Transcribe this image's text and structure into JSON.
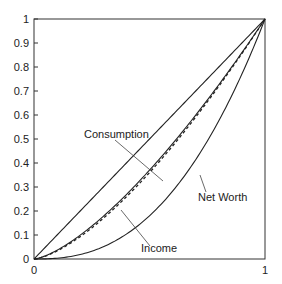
{
  "chart_data": {
    "type": "line",
    "title": "",
    "xlabel": "",
    "ylabel": "",
    "xlim": [
      0,
      1
    ],
    "ylim": [
      0,
      1
    ],
    "grid": false,
    "legend": "none (curves labeled directly with leader lines)",
    "x_ticks": [
      "0",
      "1"
    ],
    "y_ticks": [
      "0",
      "0.1",
      "0.2",
      "0.3",
      "0.4",
      "0.5",
      "0.6",
      "0.7",
      "0.8",
      "0.9",
      "1"
    ],
    "x": [
      0,
      0.1,
      0.2,
      0.3,
      0.4,
      0.5,
      0.6,
      0.7,
      0.8,
      0.9,
      1.0
    ],
    "series": [
      {
        "name": "Equality line",
        "style": "solid",
        "values": [
          0,
          0.1,
          0.2,
          0.3,
          0.4,
          0.5,
          0.6,
          0.7,
          0.8,
          0.9,
          1.0
        ]
      },
      {
        "name": "Consumption",
        "style": "solid",
        "values": [
          0,
          0.037,
          0.1,
          0.18,
          0.27,
          0.37,
          0.48,
          0.6,
          0.73,
          0.86,
          1.0
        ]
      },
      {
        "name": "Income",
        "style": "dashed",
        "values": [
          0,
          0.034,
          0.094,
          0.17,
          0.26,
          0.36,
          0.47,
          0.59,
          0.72,
          0.86,
          1.0
        ]
      },
      {
        "name": "Net Worth",
        "style": "solid",
        "values": [
          0,
          0.003,
          0.018,
          0.049,
          0.1,
          0.18,
          0.28,
          0.41,
          0.57,
          0.77,
          1.0
        ]
      }
    ],
    "annotations": [
      {
        "text": "Consumption",
        "target": "Consumption"
      },
      {
        "text": "Income",
        "target": "Income"
      },
      {
        "text": "Net Worth",
        "target": "Net Worth"
      }
    ]
  },
  "labels": {
    "consumption": "Consumption",
    "income": "Income",
    "net_worth": "Net Worth"
  },
  "axis": {
    "x0": "0",
    "x1": "1",
    "y": [
      "0",
      "0.1",
      "0.2",
      "0.3",
      "0.4",
      "0.5",
      "0.6",
      "0.7",
      "0.8",
      "0.9",
      "1"
    ]
  }
}
